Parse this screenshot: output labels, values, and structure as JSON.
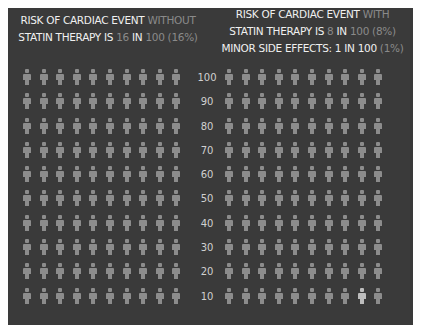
{
  "colors": {
    "background": "#ffffff",
    "panel": "#3a3a3a",
    "figure": "#8c8c8c",
    "figure_side_effect": "#bdbdbd",
    "text_primary": "#f0f0f0",
    "text_secondary": "#8a8a8a"
  },
  "header_left": {
    "parts": [
      {
        "text": "RISK OF CARDIAC EVENT ",
        "style": "w"
      },
      {
        "text": "WITHOUT",
        "style": "g"
      },
      {
        "text": "\n",
        "style": "br"
      },
      {
        "text": "STATIN THERAPY IS ",
        "style": "w"
      },
      {
        "text": "16",
        "style": "g"
      },
      {
        "text": " IN ",
        "style": "w"
      },
      {
        "text": "100",
        "style": "g"
      },
      {
        "text": " (16%)",
        "style": "g"
      }
    ]
  },
  "header_right": {
    "parts": [
      {
        "text": "RISK OF CARDIAC EVENT ",
        "style": "w"
      },
      {
        "text": "WITH",
        "style": "g"
      },
      {
        "text": "\n",
        "style": "br"
      },
      {
        "text": "STATIN THERAPY IS ",
        "style": "w"
      },
      {
        "text": "8",
        "style": "g"
      },
      {
        "text": " IN ",
        "style": "w"
      },
      {
        "text": "100",
        "style": "g"
      },
      {
        "text": " (8%)",
        "style": "g"
      },
      {
        "text": "\n",
        "style": "br"
      },
      {
        "text": "MINOR SIDE EFFECTS: 1 IN 100 ",
        "style": "w"
      },
      {
        "text": "(1%)",
        "style": "g"
      }
    ]
  },
  "axis_ticks": [
    "100",
    "90",
    "80",
    "70",
    "60",
    "50",
    "40",
    "30",
    "20",
    "10"
  ],
  "chart_data": {
    "type": "table",
    "panels": [
      {
        "name": "Without statin therapy",
        "total": 100,
        "rows": 10,
        "cols": 10,
        "cardiac_event": 16,
        "cardiac_event_percent": 16,
        "highlighted_indices": []
      },
      {
        "name": "With statin therapy",
        "total": 100,
        "rows": 10,
        "cols": 10,
        "cardiac_event": 8,
        "cardiac_event_percent": 8,
        "minor_side_effects": 1,
        "minor_side_effects_percent": 1,
        "highlighted_indices": [
          98
        ]
      }
    ],
    "axis": {
      "label": "count",
      "ticks": [
        100,
        90,
        80,
        70,
        60,
        50,
        40,
        30,
        20,
        10
      ]
    }
  }
}
